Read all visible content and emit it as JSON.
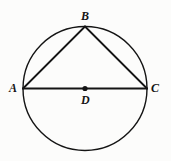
{
  "figure": {
    "background_color": "#fcfcfb",
    "stroke_color": "#141414",
    "labels": {
      "A": "A",
      "B": "B",
      "C": "C",
      "D": "D"
    }
  },
  "chart_data": {
    "type": "diagram",
    "subtype": "euclidean-geometry",
    "xlabel": "",
    "ylabel": "",
    "grid": false,
    "legend": null,
    "coordinate_space": {
      "width": 171,
      "height": 161,
      "origin": "top-left",
      "units": "px"
    },
    "shapes": [
      {
        "name": "circle",
        "type": "circle",
        "center": [
          85,
          88.5
        ],
        "radius": 62,
        "stroke": "#141414",
        "stroke_width": 1.4,
        "fill": "none"
      },
      {
        "name": "diameter-AC",
        "type": "segment",
        "from": "A",
        "to": "C",
        "points": [
          [
            23,
            88.5
          ],
          [
            147,
            88.5
          ]
        ],
        "stroke": "#141414",
        "stroke_width": 1.8
      },
      {
        "name": "chord-AB",
        "type": "segment",
        "from": "A",
        "to": "B",
        "points": [
          [
            23,
            88.5
          ],
          [
            85,
            26.5
          ]
        ],
        "stroke": "#141414",
        "stroke_width": 1.8
      },
      {
        "name": "chord-BC",
        "type": "segment",
        "from": "B",
        "to": "C",
        "points": [
          [
            85,
            26.5
          ],
          [
            147,
            88.5
          ]
        ],
        "stroke": "#141414",
        "stroke_width": 1.8
      },
      {
        "name": "center-dot-D",
        "type": "point",
        "at": [
          85,
          88.5
        ],
        "radius": 2.6,
        "fill": "#141414"
      }
    ],
    "points": [
      {
        "id": "A",
        "label": "A",
        "x": 23,
        "y": 88.5,
        "label_position": "left"
      },
      {
        "id": "B",
        "label": "B",
        "x": 85,
        "y": 26.5,
        "label_position": "above"
      },
      {
        "id": "C",
        "label": "C",
        "x": 147,
        "y": 88.5,
        "label_position": "right"
      },
      {
        "id": "D",
        "label": "D",
        "x": 85,
        "y": 88.5,
        "label_position": "below"
      }
    ],
    "annotations": []
  }
}
